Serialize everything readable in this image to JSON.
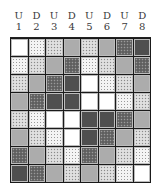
{
  "columns": [
    {
      "dir": "U",
      "num": "1"
    },
    {
      "dir": "D",
      "num": "2"
    },
    {
      "dir": "U",
      "num": "3"
    },
    {
      "dir": "D",
      "num": "4"
    },
    {
      "dir": "U",
      "num": "5"
    },
    {
      "dir": "D",
      "num": "6"
    },
    {
      "dir": "U",
      "num": "7"
    },
    {
      "dir": "D",
      "num": "8"
    }
  ],
  "tones": {
    "white": "#ffffff",
    "light": "#f4f4f4",
    "speck": "#d8d8d8",
    "mid": "#acacac",
    "darkspeck": "#6a6a6a",
    "dark": "#4f4f4f"
  },
  "grid": [
    [
      "white",
      "light",
      "speck",
      "mid",
      "speck",
      "mid",
      "darkspeck",
      "dark"
    ],
    [
      "light",
      "speck",
      "mid",
      "darkspeck",
      "light",
      "speck",
      "mid",
      "darkspeck"
    ],
    [
      "speck",
      "mid",
      "darkspeck",
      "dark",
      "white",
      "light",
      "speck",
      "mid"
    ],
    [
      "mid",
      "darkspeck",
      "dark",
      "dark",
      "white",
      "white",
      "light",
      "speck"
    ],
    [
      "speck",
      "light",
      "white",
      "white",
      "dark",
      "dark",
      "darkspeck",
      "mid"
    ],
    [
      "mid",
      "speck",
      "light",
      "white",
      "dark",
      "darkspeck",
      "mid",
      "speck"
    ],
    [
      "darkspeck",
      "mid",
      "speck",
      "light",
      "darkspeck",
      "mid",
      "speck",
      "light"
    ],
    [
      "dark",
      "darkspeck",
      "mid",
      "speck",
      "mid",
      "speck",
      "light",
      "white"
    ]
  ]
}
